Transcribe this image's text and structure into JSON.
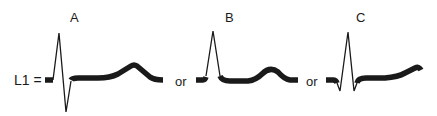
{
  "figure": {
    "lead_label": "L1 =",
    "separator": "or",
    "panels": [
      {
        "id": "A",
        "label": "A",
        "description": "biphasic QRS (tall R, deep S) with normal ST and upright T wave"
      },
      {
        "id": "B",
        "label": "B",
        "description": "tall R wave without S, ST isoelectric, upright T wave"
      },
      {
        "id": "C",
        "label": "C",
        "description": "small q, tall R, small s, upsloping ST segment into T wave"
      }
    ]
  }
}
